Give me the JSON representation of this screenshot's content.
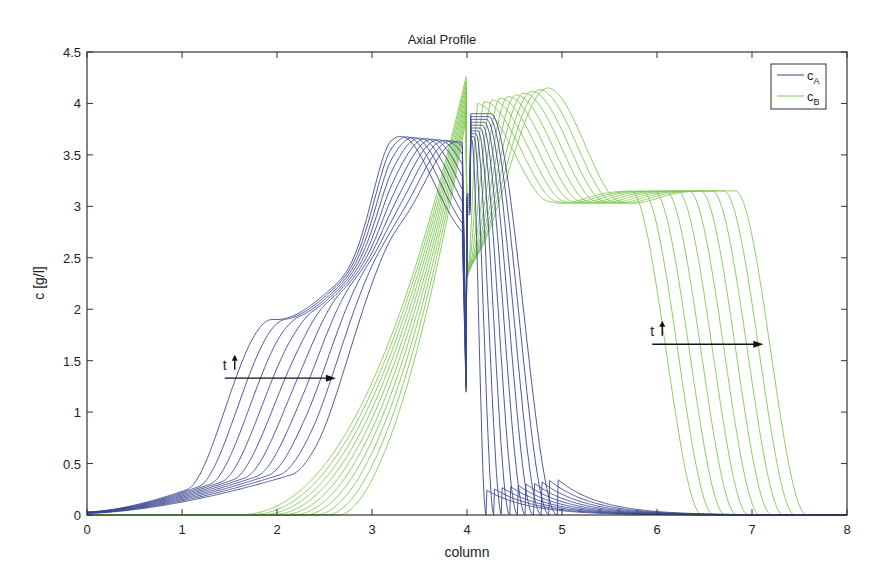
{
  "chart_data": {
    "type": "line",
    "title": "Axial Profile",
    "xlabel": "column",
    "ylabel": "c [g/l]",
    "xlim": [
      0,
      8
    ],
    "ylim": [
      0,
      4.5
    ],
    "xticks": [
      "0",
      "1",
      "2",
      "3",
      "4",
      "5",
      "6",
      "7",
      "8"
    ],
    "yticks": [
      "0",
      "0.5",
      "1",
      "1.5",
      "2",
      "2.5",
      "3",
      "3.5",
      "4",
      "4.5"
    ],
    "grid": false,
    "legend": {
      "position": "upper right",
      "entries": [
        {
          "label": "c",
          "sub": "A",
          "color": "#3a4592"
        },
        {
          "label": "c",
          "sub": "B",
          "color": "#7ec850"
        }
      ]
    },
    "annotations": [
      {
        "text": "t",
        "arrow": "up",
        "x": 1.55,
        "y": 1.45,
        "note": "time direction arrow from x=1.55 to x=2.6 at y=1.33"
      },
      {
        "text": "t",
        "arrow": "up",
        "x": 6.0,
        "y": 1.7,
        "note": "time direction arrow from x=6.0 to x=7.1 at y=1.66"
      }
    ],
    "series": [
      {
        "name": "c_A",
        "color": "#3a4592",
        "curve_count": 10,
        "description": "Family of 10 time-snapshot profiles of component A",
        "representative_points": {
          "first": {
            "x": [
              0,
              1,
              1.5,
              2,
              3,
              3.3,
              3.7,
              4.0,
              4.05,
              4.5,
              5,
              5.5,
              6,
              8
            ],
            "y": [
              0.03,
              0.22,
              1.3,
              1.9,
              2.55,
              3.68,
              3.5,
              0.0,
              3.9,
              3.6,
              1.4,
              0.35,
              0.06,
              0.0
            ]
          },
          "last": {
            "x": [
              0,
              1,
              2,
              2.5,
              3,
              3.6,
              3.9,
              4.0,
              4.05,
              4.2,
              4.5,
              5,
              6,
              8
            ],
            "y": [
              0.02,
              0.12,
              0.25,
              1.5,
              1.95,
              2.6,
              3.1,
              1.2,
              3.7,
              2.0,
              0.8,
              0.2,
              0.02,
              0.0
            ]
          }
        }
      },
      {
        "name": "c_B",
        "color": "#7ec850",
        "curve_count": 10,
        "description": "Family of 10 time-snapshot profiles of component B",
        "representative_points": {
          "first": {
            "x": [
              1.5,
              2,
              2.5,
              3,
              3.5,
              4.0,
              4.05,
              4.5,
              5,
              5.9,
              6.3,
              6.7,
              8
            ],
            "y": [
              0.0,
              0.05,
              0.4,
              1.2,
              3.4,
              4.3,
              2.3,
              3.1,
              3.15,
              3.15,
              2.0,
              0.2,
              0.0
            ]
          },
          "last": {
            "x": [
              2.7,
              3,
              3.5,
              3.9,
              4.0,
              4.3,
              4.85,
              5.2,
              6.5,
              7.0,
              7.5,
              8
            ],
            "y": [
              0.0,
              0.3,
              1.3,
              2.6,
              3.9,
              3.9,
              4.15,
              3.2,
              3.15,
              2.0,
              0.3,
              0.0
            ]
          }
        }
      }
    ]
  }
}
